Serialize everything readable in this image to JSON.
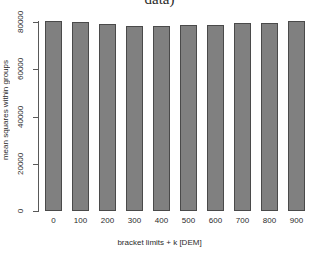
{
  "chart_data": {
    "type": "bar",
    "title": "data)",
    "xlabel": "bracket limits + k [DEM]",
    "ylabel": "mean squares within groups",
    "categories": [
      "0",
      "100",
      "200",
      "300",
      "400",
      "500",
      "600",
      "700",
      "800",
      "900"
    ],
    "values": [
      80300,
      79900,
      79100,
      78500,
      78500,
      78700,
      78800,
      79500,
      79600,
      80300
    ],
    "ylim": [
      0,
      80000
    ],
    "yticks": [
      0,
      20000,
      40000,
      60000,
      80000
    ],
    "ytick_labels": [
      "0",
      "20000",
      "40000",
      "60000",
      "80000"
    ],
    "grid": false,
    "legend": false,
    "bar_fill": "#808080",
    "bar_border": "#4a4a4a",
    "axis_color": "#595959",
    "background": "#ffffff"
  }
}
